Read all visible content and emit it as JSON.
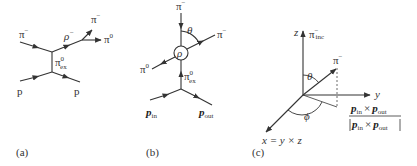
{
  "figure": {
    "panels": [
      {
        "id": "a",
        "caption": "(a)",
        "labels": {
          "pi_minus_in": "π",
          "pi_minus_in_sup": "−",
          "rho": "ρ",
          "rho_sup": "−",
          "pi_minus_out": "π",
          "pi_minus_out_sup": "−",
          "pi_zero_out": "π",
          "pi_zero_out_sup": "0",
          "exchange": "π",
          "exchange_sup": "0",
          "exchange_sub": "ex",
          "p_in": "p",
          "p_out": "p"
        }
      },
      {
        "id": "b",
        "caption": "(b)",
        "labels": {
          "pi_minus_in": "π",
          "pi_minus_in_sup": "−",
          "theta": "θ",
          "rho_circle": "ρ",
          "pi_minus_out": "π",
          "pi_minus_out_sup": "−",
          "pi_zero_out": "π",
          "pi_zero_out_sup": "0",
          "exchange": "π",
          "exchange_sup": "0",
          "exchange_sub": "ex",
          "p_in": "p",
          "p_in_sub": "in",
          "p_out": "p",
          "p_out_sub": "out"
        }
      },
      {
        "id": "c",
        "caption": "(c)",
        "labels": {
          "z_axis": "z",
          "pi_inc": "π",
          "pi_inc_sup": "−",
          "pi_inc_sub": "inc",
          "theta": "θ",
          "pi_minus": "π",
          "pi_minus_sup": "−",
          "y_axis": "y",
          "phi": "ϕ",
          "x_axis_def": "x = y × z",
          "normal_num_p1": "p",
          "normal_num_p1_sub": "in",
          "normal_times": "×",
          "normal_num_p2": "p",
          "normal_num_p2_sub": "out",
          "normal_den_p1": "p",
          "normal_den_p1_sub": "in",
          "normal_den_times": "×",
          "normal_den_p2": "p",
          "normal_den_p2_sub": "out"
        }
      }
    ]
  }
}
